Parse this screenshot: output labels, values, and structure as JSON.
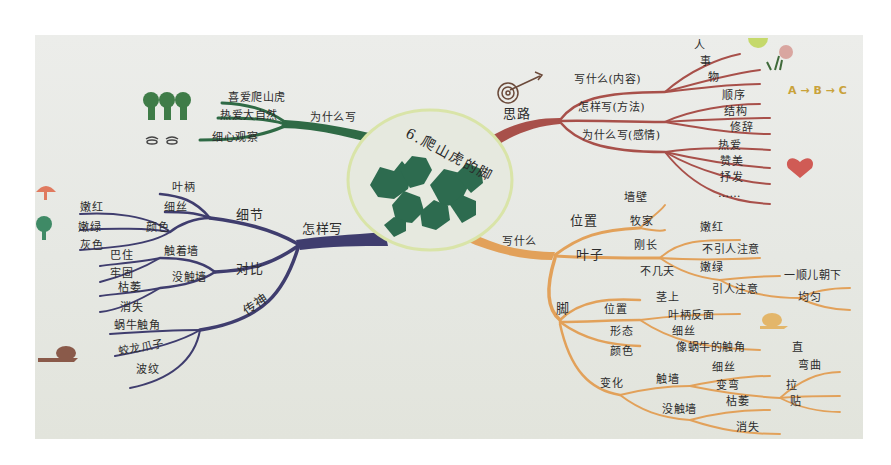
{
  "center": {
    "title": "6.爬山虎的脚"
  },
  "colors": {
    "paper": "#e8e9e5",
    "green_branch": "#2f6a45",
    "red_branch": "#a8504a",
    "purple_branch": "#3f3d6e",
    "orange_branch": "#e2a15a",
    "leaf": "#2d6b4f",
    "circle_border": "#d9e4a8"
  },
  "branches": {
    "why": {
      "label": "为什么写",
      "children": [
        "喜爱爬山虎",
        "热爱大自然",
        "细心观察"
      ]
    },
    "outline": {
      "label": "思路",
      "children": [
        {
          "label": "写什么(内容)",
          "children": [
            "人",
            "事",
            "物"
          ]
        },
        {
          "label": "怎样写(方法)",
          "children": [
            "顺序",
            "结构",
            "修辞"
          ]
        },
        {
          "label": "为什么写(感情)",
          "children": [
            "热爱",
            "赞美",
            "抒发",
            "……"
          ]
        }
      ]
    },
    "how": {
      "label": "怎样写",
      "children": [
        {
          "label": "细节",
          "children": [
            {
              "label": "叶柄",
              "children": []
            },
            {
              "label": "细丝",
              "children": []
            },
            {
              "label": "颜色",
              "children": [
                "嫩红",
                "嫩绿",
                "灰色"
              ]
            }
          ]
        },
        {
          "label": "对比",
          "children": [
            {
              "label": "触着墙",
              "children": [
                "巴住",
                "牢固"
              ]
            },
            {
              "label": "没触墙",
              "children": [
                "枯萎",
                "消失"
              ]
            }
          ]
        },
        {
          "label": "传神",
          "children": [
            "蜗牛触角",
            "蛟龙爪子",
            "波纹"
          ]
        }
      ]
    },
    "what": {
      "label": "写什么",
      "children": [
        {
          "label": "位置",
          "children": [
            "茎上",
            "叶柄反面"
          ]
        },
        {
          "label": "叶子",
          "children": [
            {
              "label": "刚长",
              "children": [
                "嫩红",
                "不引人注意"
              ]
            },
            {
              "label": "不几天",
              "children": [
                "嫩绿",
                {
                  "label": "引人注意",
                  "children": [
                    "一顺儿朝下",
                    "均匀"
                  ]
                }
              ]
            }
          ]
        },
        {
          "label": "脚",
          "children": [
            {
              "label": "位置",
              "children": [
                "茎上",
                "叶柄反面"
              ]
            },
            {
              "label": "形态",
              "children": [
                "细丝",
                "像蜗牛的触角"
              ]
            },
            {
              "label": "颜色",
              "children": [
                "嫩红"
              ]
            },
            {
              "label": "变化",
              "children": [
                {
                  "label": "触墙",
                  "children": [
                    "细丝",
                    "变弯",
                    "拉",
                    "贴",
                    "直",
                    "弯曲"
                  ]
                },
                {
                  "label": "没触墙",
                  "children": [
                    "枯萎",
                    "消失"
                  ]
                }
              ]
            }
          ]
        }
      ],
      "top_children": [
        "墙壁",
        "牧家"
      ]
    }
  },
  "labels": {
    "why_1": "喜爱爬山虎",
    "why_2": "热爱大自然",
    "why_3": "细心观察",
    "why_main": "为什么写",
    "outline_main": "思路",
    "outline_1": "写什么(内容)",
    "outline_2": "怎样写(方法)",
    "outline_3": "为什么写(感情)",
    "o_ren": "人",
    "o_shi": "事",
    "o_wu": "物",
    "o_shunxu": "顺序",
    "o_jiegou": "结构",
    "o_xiuci": "修辞",
    "o_reai": "热爱",
    "o_zanmei": "赞美",
    "o_shufa": "抒发",
    "o_more": "……",
    "abc": "A → B → C",
    "how_main": "怎样写",
    "how_xijie": "细节",
    "how_yebing": "叶柄",
    "how_xisi": "细丝",
    "how_yanse": "颜色",
    "how_nenhong": "嫩红",
    "how_nenlv": "嫩绿",
    "how_huise": "灰色",
    "how_duibi": "对比",
    "how_chuzhe": "触着墙",
    "how_bazhu": "巴住",
    "how_laogu": "牢固",
    "how_meichu": "没触墙",
    "how_kuwei": "枯萎",
    "how_xiaoshi": "消失",
    "how_chuanshen": "传神",
    "how_woniu": "蜗牛触角",
    "how_jiaolong": "蛟龙爪子",
    "how_bowen": "波纹",
    "what_main": "写什么",
    "what_weizhi": "位置",
    "what_qiangbi": "墙壁",
    "what_mujia": "牧家",
    "what_yezi": "叶子",
    "what_gangzhang": "刚长",
    "what_nenhong": "嫩红",
    "what_buyin": "不引人注意",
    "what_bujitian": "不几天",
    "what_nenlv": "嫩绿",
    "what_yinren": "引人注意",
    "what_yishun": "一顺儿朝下",
    "what_junyun": "均匀",
    "what_jiao": "脚",
    "what_jweizhi": "位置",
    "what_jingshang": "茎上",
    "what_yebingfan": "叶柄反面",
    "what_xingtai": "形态",
    "what_xisi": "细丝",
    "what_xiangwoniu": "像蜗牛的触角",
    "what_jyanse": "颜色",
    "what_bianhua": "变化",
    "what_chuqiang": "触墙",
    "what_xisi2": "细丝",
    "what_biangwan": "变弯",
    "what_zhi": "直",
    "what_wanqu": "弯曲",
    "what_la": "拉",
    "what_tie": "贴",
    "what_meichuqiang": "没触墙",
    "what_kuwei": "枯萎",
    "what_xiaoshi": "消失"
  }
}
